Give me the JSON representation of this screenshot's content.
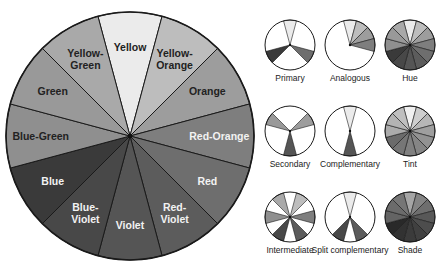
{
  "main_wheel": {
    "center": [
      130,
      136
    ],
    "radius": 124,
    "segments": [
      {
        "name": "Yellow",
        "lines": [
          "Yellow"
        ],
        "angle": 0,
        "fill": "#ebebeb",
        "text": "#222222"
      },
      {
        "name": "Yellow-Orange",
        "lines": [
          "Yellow-",
          "Orange"
        ],
        "angle": 30,
        "fill": "#bdbdbd",
        "text": "#222222"
      },
      {
        "name": "Orange",
        "lines": [
          "Orange"
        ],
        "angle": 60,
        "fill": "#9d9d9d",
        "text": "#222222"
      },
      {
        "name": "Red-Orange",
        "lines": [
          "Red-Orange"
        ],
        "angle": 90,
        "fill": "#7e7e7e",
        "text": "#f2f2f2"
      },
      {
        "name": "Red",
        "lines": [
          "Red"
        ],
        "angle": 120,
        "fill": "#6e6e6e",
        "text": "#f2f2f2"
      },
      {
        "name": "Red-Violet",
        "lines": [
          "Red-",
          "Violet"
        ],
        "angle": 150,
        "fill": "#5c5c5c",
        "text": "#f2f2f2"
      },
      {
        "name": "Violet",
        "lines": [
          "Violet"
        ],
        "angle": 180,
        "fill": "#555555",
        "text": "#f2f2f2"
      },
      {
        "name": "Blue-Violet",
        "lines": [
          "Blue-",
          "Violet"
        ],
        "angle": 210,
        "fill": "#484848",
        "text": "#f2f2f2"
      },
      {
        "name": "Blue",
        "lines": [
          "Blue"
        ],
        "angle": 240,
        "fill": "#3a3a3a",
        "text": "#f2f2f2"
      },
      {
        "name": "Blue-Green",
        "lines": [
          "Blue-Green"
        ],
        "angle": 270,
        "fill": "#8f8f8f",
        "text": "#222222"
      },
      {
        "name": "Green",
        "lines": [
          "Green"
        ],
        "angle": 300,
        "fill": "#999999",
        "text": "#222222"
      },
      {
        "name": "Yellow-Green",
        "lines": [
          "Yellow-",
          "Green"
        ],
        "angle": 330,
        "fill": "#a9a9a9",
        "text": "#222222"
      }
    ]
  },
  "schemes": [
    {
      "label": "Primary",
      "center": [
        290,
        45
      ],
      "mode": "select",
      "filled": [
        0,
        4,
        8
      ]
    },
    {
      "label": "Analogous",
      "center": [
        350,
        45
      ],
      "mode": "select",
      "filled": [
        0,
        1,
        2,
        3
      ]
    },
    {
      "label": "Hue",
      "center": [
        410,
        45
      ],
      "mode": "all"
    },
    {
      "label": "Secondary",
      "center": [
        290,
        131
      ],
      "mode": "select",
      "filled": [
        2,
        6,
        10
      ]
    },
    {
      "label": "Complementary",
      "center": [
        350,
        131
      ],
      "mode": "select",
      "filled": [
        0,
        6
      ]
    },
    {
      "label": "Tint",
      "center": [
        410,
        131
      ],
      "mode": "tint"
    },
    {
      "label": "Intermediate",
      "center": [
        290,
        217
      ],
      "mode": "select",
      "filled": [
        1,
        3,
        5,
        7,
        9,
        11
      ]
    },
    {
      "label": "Split complementary",
      "center": [
        350,
        217
      ],
      "mode": "select",
      "filled": [
        0,
        5,
        7
      ]
    },
    {
      "label": "Shade",
      "center": [
        410,
        217
      ],
      "mode": "shade"
    }
  ],
  "small_wheel_radius": 25,
  "label_offset": 36,
  "colors": {
    "outline": "#1a1a1a",
    "empty": "#ffffff",
    "background": "#ffffff"
  }
}
